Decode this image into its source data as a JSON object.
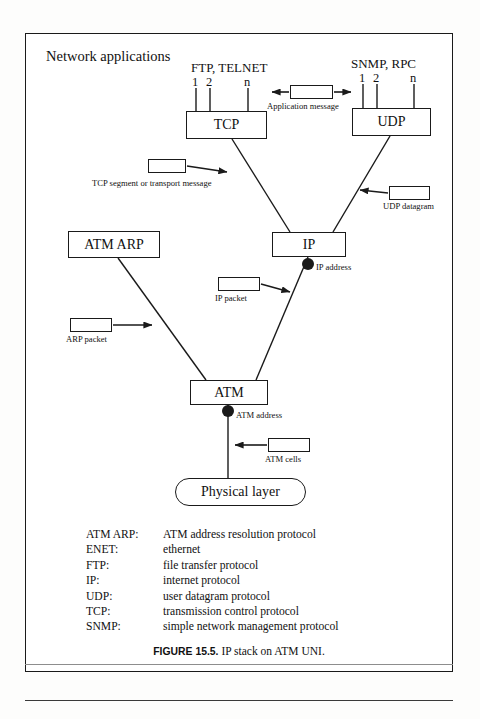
{
  "figure": {
    "title_label": "Network applications",
    "caption_number": "FIGURE 15.5.",
    "caption_text": "IP stack on ATM UNI."
  },
  "stack": {
    "app_groups": [
      {
        "name": "tcp-apps",
        "label": "FTP, TELNET",
        "ports": [
          "1",
          "2",
          "n"
        ]
      },
      {
        "name": "udp-apps",
        "label": "SNMP, RPC",
        "ports": [
          "1",
          "2",
          "n"
        ]
      }
    ],
    "boxes": [
      {
        "name": "tcp",
        "label": "TCP"
      },
      {
        "name": "udp",
        "label": "UDP"
      },
      {
        "name": "ip",
        "label": "IP"
      },
      {
        "name": "atm_arp",
        "label": "ATM ARP"
      },
      {
        "name": "atm",
        "label": "ATM"
      },
      {
        "name": "physical",
        "label": "Physical layer"
      }
    ],
    "address_points": [
      {
        "name": "ip-address",
        "label": "IP address"
      },
      {
        "name": "atm-address",
        "label": "ATM address"
      }
    ]
  },
  "callouts": [
    {
      "name": "application-message",
      "label": "Application message"
    },
    {
      "name": "tcp-segment",
      "label": "TCP segment or transport message"
    },
    {
      "name": "udp-datagram",
      "label": "UDP datagram"
    },
    {
      "name": "ip-packet",
      "label": "IP packet"
    },
    {
      "name": "arp-packet",
      "label": "ARP packet"
    },
    {
      "name": "atm-cells",
      "label": "ATM cells"
    }
  ],
  "legend": [
    {
      "term": "ATM ARP:",
      "definition": "ATM address resolution protocol"
    },
    {
      "term": "ENET:",
      "definition": "ethernet"
    },
    {
      "term": "FTP:",
      "definition": "file transfer protocol"
    },
    {
      "term": "IP:",
      "definition": "internet protocol"
    },
    {
      "term": "UDP:",
      "definition": "user datagram protocol"
    },
    {
      "term": "TCP:",
      "definition": "transmission control protocol"
    },
    {
      "term": "SNMP:",
      "definition": "simple network management protocol"
    }
  ],
  "colors": {
    "ink": "#1a1a1a",
    "paper": "#ffffff",
    "rule": "#8d8d8d"
  }
}
